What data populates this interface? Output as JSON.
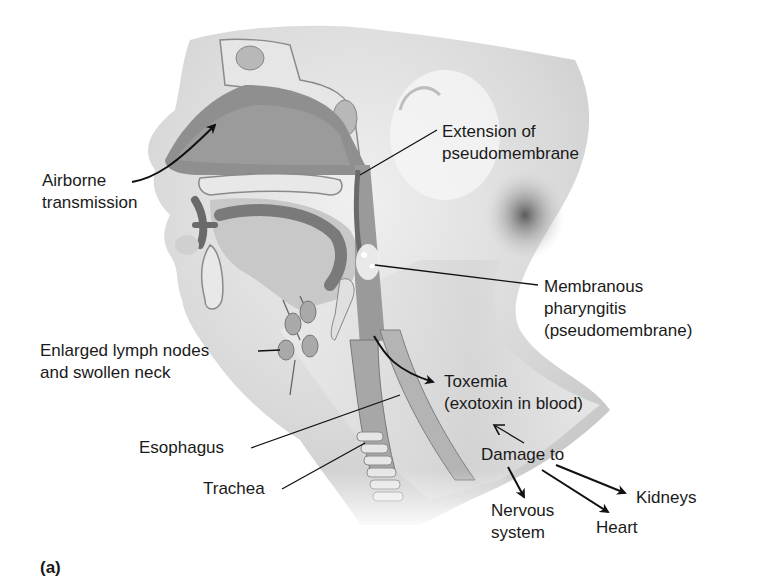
{
  "figure": {
    "panel_label": "(a)",
    "colors": {
      "background": "#ffffff",
      "tissue_light": "#e2e2e2",
      "tissue_mid": "#a8a8a8",
      "tissue_dark": "#6e6e6e",
      "label_text": "#1a1a1a"
    }
  },
  "labels": {
    "airborne": {
      "line1": "Airborne",
      "line2": "transmission"
    },
    "extension": {
      "line1": "Extension of",
      "line2": "pseudomembrane"
    },
    "membranous": {
      "line1": "Membranous",
      "line2": "pharyngitis",
      "line3": "(pseudomembrane)"
    },
    "lymph": {
      "line1": "Enlarged lymph nodes",
      "line2": "and swollen neck"
    },
    "toxemia": {
      "line1": "Toxemia",
      "line2": "(exotoxin in blood)"
    },
    "esophagus": {
      "line1": "Esophagus"
    },
    "damage": {
      "line1": "Damage to"
    },
    "trachea": {
      "line1": "Trachea"
    },
    "kidneys": {
      "line1": "Kidneys"
    },
    "nervous": {
      "line1": "Nervous",
      "line2": "system"
    },
    "heart": {
      "line1": "Heart"
    }
  }
}
